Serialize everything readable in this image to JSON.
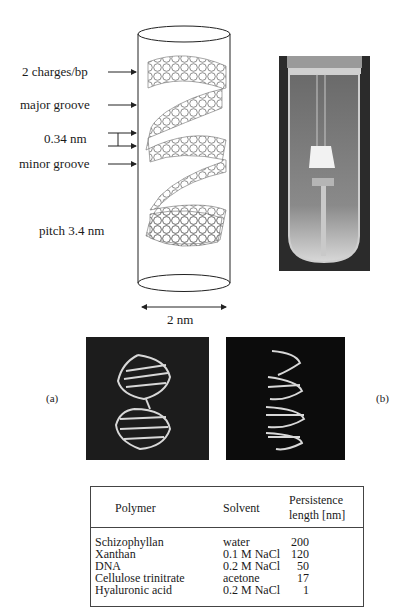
{
  "figure": {
    "clipped_caption_top": "",
    "dna_cylinder": {
      "labels": [
        {
          "id": "charges",
          "text": "2 charges/bp"
        },
        {
          "id": "major",
          "text": "major groove"
        },
        {
          "id": "rise",
          "text": "0.34 nm"
        },
        {
          "id": "minor",
          "text": "minor groove"
        },
        {
          "id": "pitch",
          "text": "pitch 3.4 nm"
        }
      ],
      "width_label": "2 nm"
    },
    "photo": {
      "description": "test tube with DNA gel"
    },
    "panels": {
      "a_label": "(a)",
      "b_label": "(b)"
    },
    "table": {
      "headers": [
        "Polymer",
        "Solvent",
        "Persistence length [nm]"
      ],
      "rows": [
        {
          "polymer": "Schizophyllan",
          "solvent": "water",
          "length": "200"
        },
        {
          "polymer": "Xanthan",
          "solvent": "0.1 M NaCl",
          "length": "120"
        },
        {
          "polymer": "DNA",
          "solvent": "0.2 M NaCl",
          "length": "50"
        },
        {
          "polymer": "Cellulose trinitrate",
          "solvent": "acetone",
          "length": "17"
        },
        {
          "polymer": "Hyaluronic acid",
          "solvent": "0.2 M NaCl",
          "length": "1"
        }
      ]
    }
  }
}
